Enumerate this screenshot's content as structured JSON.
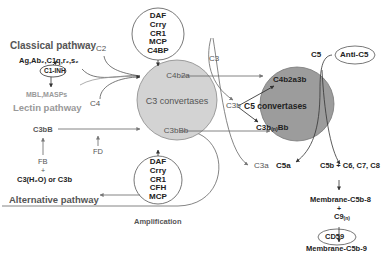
{
  "pathways": {
    "classical": "Classical pathway",
    "classical_components": "Ag,Ab₂,C1q,r₂,s₂",
    "c1_inhibitor": "C1-INH",
    "lectin_components": "MBL,MASPs",
    "lectin": "Lectin pathway",
    "alternative": "Alternative pathway",
    "amplification": "Amplification"
  },
  "inputs": {
    "c2": "C2",
    "c4": "C4",
    "c3": "C3",
    "c5": "C5",
    "fd": "FD",
    "fb": "FB",
    "plus": "+",
    "c3h2o_or_c3b": "C3(H₂O) or C3b"
  },
  "alt_initial": "C3bB",
  "regulators_top": [
    "DAF",
    "Crry",
    "CR1",
    "MCP",
    "C4BP"
  ],
  "regulators_bottom": [
    "DAF",
    "Crry",
    "CR1",
    "CFH",
    "MCP"
  ],
  "c3_convertases": {
    "title": "C3 convertases",
    "classical": "C4b2a",
    "alternative": "C3bBb"
  },
  "c5_convertases": {
    "title": "C5 convertases",
    "classical": "C4b2a3b",
    "alternative_main": "C3b",
    "alternative_sub": "(n)",
    "alternative_tail": "Bb",
    "c3b_label": "C3b"
  },
  "products": {
    "c3a": "C3a",
    "c5a": "C5a",
    "anti_c5": "Anti-C5",
    "c5b_combo": "C5b + C6, C7, C8",
    "mac_c5b8": "Membrane-C5b-8",
    "plus": "+",
    "c9": "C9",
    "c9_sub": "(n)",
    "cd59": "CD59",
    "mac_c5b9": "Membrane-C5b-9"
  },
  "colors": {
    "c3_circle": "#d3d3d3",
    "c5_circle": "#9c9c9c",
    "line": "#555555"
  }
}
